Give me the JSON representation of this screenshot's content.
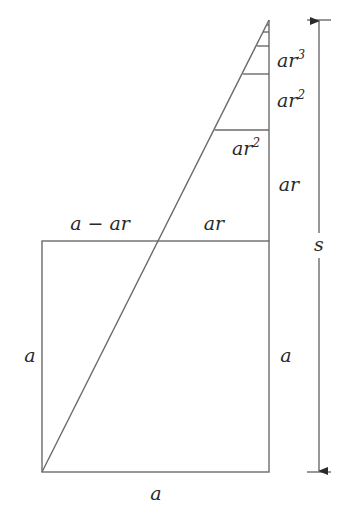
{
  "figure": {
    "labels": {
      "top_left": "a − ar",
      "top_right": "ar",
      "left_side": "a",
      "right_side": "a",
      "bottom": "a",
      "total": "s",
      "seg_ar": "ar",
      "seg_ar2_inner": "ar",
      "seg_ar2_inner_exp": "2",
      "seg_ar2_outer": "ar",
      "seg_ar2_outer_exp": "2",
      "seg_ar3": "ar",
      "seg_ar3_exp": "3"
    },
    "colors": {
      "line": "#6b6b6b",
      "text": "#2a2a2a",
      "background": "#ffffff"
    }
  }
}
